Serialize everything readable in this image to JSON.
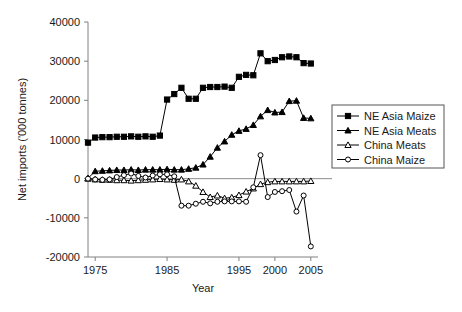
{
  "chart_data": {
    "type": "line",
    "title": "",
    "xlabel": "Year",
    "ylabel": "Net imports ('000 tonnes)",
    "xlim": [
      1974,
      2006
    ],
    "ylim": [
      -20000,
      40000
    ],
    "xticks": [
      1975,
      1985,
      1995,
      2000,
      2005
    ],
    "xtick_labels": [
      "1975",
      "1985",
      "1995",
      "2000",
      "2005"
    ],
    "yticks": [
      -20000,
      -10000,
      0,
      10000,
      20000,
      30000,
      40000
    ],
    "ytick_labels": [
      "-20000",
      "-10000",
      "0",
      "10000",
      "20000",
      "30000",
      "40000"
    ],
    "grid": false,
    "legend_position": "right",
    "x": [
      1974,
      1975,
      1976,
      1977,
      1978,
      1979,
      1980,
      1981,
      1982,
      1983,
      1984,
      1985,
      1986,
      1987,
      1988,
      1989,
      1990,
      1991,
      1992,
      1993,
      1994,
      1995,
      1996,
      1997,
      1998,
      1999,
      2000,
      2001,
      2002,
      2003,
      2004,
      2005
    ],
    "series": [
      {
        "name": "NE Asia Maize",
        "marker": "filled-square",
        "values": [
          9200,
          10500,
          10600,
          10600,
          10700,
          10700,
          10800,
          10700,
          10800,
          10700,
          11000,
          20200,
          21600,
          23200,
          20400,
          20400,
          23200,
          23400,
          23400,
          23500,
          23200,
          26000,
          26500,
          26400,
          32000,
          30000,
          30300,
          31000,
          31200,
          31000,
          29500,
          29400
        ]
      },
      {
        "name": "NE Asia Meats",
        "marker": "filled-triangle",
        "values": [
          100,
          1900,
          2000,
          2100,
          2200,
          2200,
          2300,
          2200,
          2300,
          2300,
          2300,
          2400,
          2300,
          2300,
          2500,
          2800,
          3600,
          5600,
          7900,
          9500,
          11200,
          12200,
          12700,
          13700,
          15900,
          17500,
          16900,
          17000,
          19800,
          19900,
          15500,
          15400
        ]
      },
      {
        "name": "China Meats",
        "marker": "open-triangle",
        "values": [
          0,
          -200,
          -300,
          -300,
          -400,
          -400,
          -500,
          -400,
          -300,
          -200,
          -100,
          -200,
          -300,
          -200,
          -700,
          -1800,
          -3400,
          -4700,
          -4300,
          -5000,
          -4800,
          -4200,
          -3300,
          -2500,
          -1400,
          -900,
          -700,
          -700,
          -700,
          -700,
          -700,
          -600
        ]
      },
      {
        "name": "China Maize",
        "marker": "open-circle",
        "values": [
          0,
          -200,
          -300,
          -200,
          400,
          900,
          1300,
          700,
          300,
          800,
          1100,
          1100,
          600,
          -6900,
          -6900,
          -6400,
          -5900,
          -6300,
          -5900,
          -5800,
          -5800,
          -5800,
          -5900,
          -2200,
          6000,
          -4700,
          -3400,
          -3200,
          -2900,
          -8400,
          -4300,
          -17300
        ]
      }
    ]
  },
  "axes": {
    "ylabel": "Net imports ('000 tonnes)",
    "xlabel": "Year"
  },
  "legend": {
    "items": [
      {
        "label": "NE Asia Maize",
        "marker": "filled-square"
      },
      {
        "label": "NE Asia Meats",
        "marker": "filled-triangle"
      },
      {
        "label": "China Meats",
        "marker": "open-triangle"
      },
      {
        "label": "China Maize",
        "marker": "open-circle"
      }
    ]
  }
}
